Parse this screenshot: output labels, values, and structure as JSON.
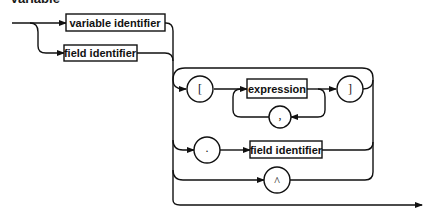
{
  "title": "Variable",
  "diagram": {
    "type": "syntax-diagram",
    "nonterminals": {
      "variable_identifier": "variable identifier",
      "field_identifier_1": "field identifier",
      "expression": "expression",
      "field_identifier_2": "field identifier"
    },
    "terminals": {
      "open_bracket": "[",
      "close_bracket": "]",
      "comma": ",",
      "period": ".",
      "caret": "^"
    },
    "colors": {
      "line": "#111111",
      "background": "#ffffff"
    }
  }
}
